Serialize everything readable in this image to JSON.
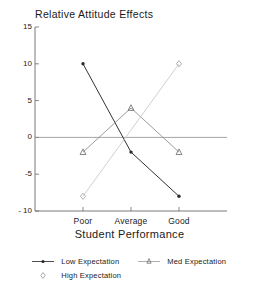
{
  "chart_data": {
    "type": "line",
    "title": "Relative Attitude Effects",
    "xlabel": "Student Performance",
    "ylabel": "",
    "categories": [
      "Poor",
      "Average",
      "Good"
    ],
    "ylim": [
      -10,
      15
    ],
    "yticks": [
      15,
      10,
      5,
      0,
      -5,
      "- 10"
    ],
    "ytick_values": [
      15,
      10,
      5,
      0,
      -5,
      -10
    ],
    "grid": false,
    "legend_position": "bottom",
    "zero_line": true,
    "series": [
      {
        "name": "Low Expectation",
        "marker": "dot",
        "color": "#333333",
        "has_line": true,
        "values": [
          10,
          -2,
          -8
        ]
      },
      {
        "name": "Med Expectation",
        "marker": "triangle",
        "color": "#8a8a8a",
        "has_line": true,
        "values": [
          -2,
          4,
          -2
        ]
      },
      {
        "name": "High Expectation",
        "marker": "diamond",
        "color": "#c8c8c8",
        "has_line": true,
        "values": [
          -8,
          null,
          10
        ]
      }
    ]
  },
  "legend": {
    "entries": [
      {
        "label": "Low Expectation",
        "marker": "dot-line-key"
      },
      {
        "label": "Med Expectation",
        "marker": "triangle-line-key"
      },
      {
        "label": "High Expectation",
        "marker": "diamond-key"
      }
    ]
  }
}
